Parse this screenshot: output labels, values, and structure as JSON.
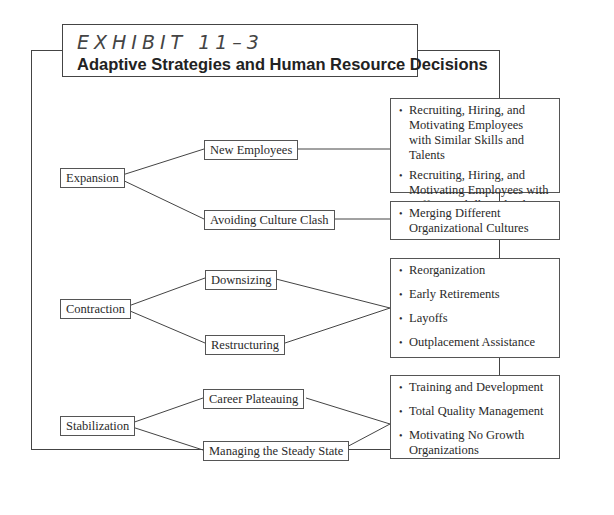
{
  "exhibit": {
    "number_label": "EXHIBIT 11–3",
    "title": "Adaptive Strategies and Human Resource Decisions"
  },
  "strategies": [
    {
      "label": "Expansion",
      "branches": [
        {
          "label": "New Employees"
        },
        {
          "label": "Avoiding Culture Clash"
        }
      ]
    },
    {
      "label": "Contraction",
      "branches": [
        {
          "label": "Downsizing"
        },
        {
          "label": "Restructuring"
        }
      ]
    },
    {
      "label": "Stabilization",
      "branches": [
        {
          "label": "Career Plateauing"
        },
        {
          "label": "Managing the Steady State"
        }
      ]
    }
  ],
  "outcomes": {
    "new_employees": [
      {
        "line1": "Recruiting, Hiring, and",
        "line2": "Motivating Employees",
        "line3": "with Similar Skills and Talents"
      },
      {
        "line1": "Recruiting, Hiring, and",
        "line2": "Motivating Employees with",
        "line3": "Different Skills and Talents"
      }
    ],
    "culture_clash": [
      {
        "line1": "Merging Different",
        "line2": "Organizational Cultures"
      }
    ],
    "contraction": [
      "Reorganization",
      "Early Retirements",
      "Layoffs",
      "Outplacement Assistance"
    ],
    "stabilization": [
      {
        "line1": "Training and Development"
      },
      {
        "line1": "Total Quality Management"
      },
      {
        "line1": "Motivating No Growth",
        "line2": "Organizations"
      }
    ]
  }
}
